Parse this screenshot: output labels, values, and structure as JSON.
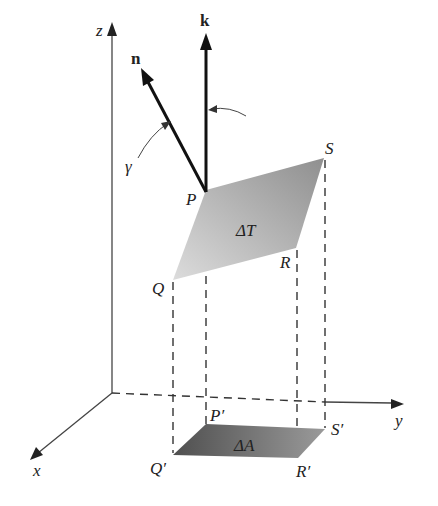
{
  "figure": {
    "axes": {
      "x_label": "x",
      "y_label": "y",
      "z_label": "z"
    },
    "vectors": {
      "normal_label": "n",
      "k_label": "k",
      "angle_label": "γ"
    },
    "surface_patch": {
      "label": "ΔT",
      "vertices": [
        "P",
        "Q",
        "R",
        "S"
      ]
    },
    "projection": {
      "label": "ΔA",
      "vertices": [
        "P′",
        "Q′",
        "R′",
        "S′"
      ]
    },
    "colors": {
      "patch_light": "#d4d4d4",
      "patch_dark": "#9a9a9a",
      "projection_dark": "#5a5a5a",
      "projection_light": "#909090",
      "line": "#222222"
    }
  }
}
